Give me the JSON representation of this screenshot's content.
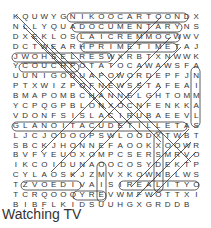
{
  "puzzle": {
    "title": "Watching TV",
    "rows": [
      "KQUWYGNIKOOCARTOONDX",
      "NLLYQUADOCUMENTARYNS",
      "DXEKLOSLAICREMMOCWWV",
      "DCTWEARHPRIMETIMETAJ",
      "JWOHSELRESWXRBTXNWWK",
      "YCOUCHPOTATOCAWAWSFA",
      "UUNIGODUAPOWORDEPFJN",
      "PTXWIZPOFNEWSSTAFEAI",
      "BMAPOMBCHANNELGHTOMM",
      "YCPQGPBLONXOCNFENKKA",
      "VDONFSISLACIRUBAEEVL",
      "GLANOITACUDETILLETAS",
      "LJCJODOOPSWLOODXTWBT",
      "SBCKJHONNEFAOOKXOOWR",
      "BVFYEUOXOMPCSERSMRVO",
      "IKCOIDUNAOOCOSYDEKTP",
      "CYLAOSKJZMVXKOWNBLWS",
      "TZVOEDIVAISIREALITY",
      "OTCRQOOQYREVWMFWOTTX",
      "IBIBFLKIDSUUHGXGRDDB"
    ]
  }
}
